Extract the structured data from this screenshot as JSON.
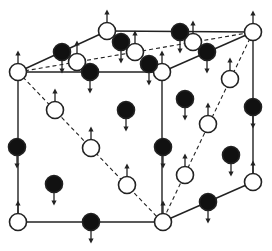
{
  "diagram": {
    "type": "crystal-structure-spin-lattice",
    "colors": {
      "line": "#222222",
      "white_atom": "#ffffff",
      "black_atom": "#111111"
    },
    "solid_lines": [
      [
        18,
        72,
        107,
        31
      ],
      [
        107,
        31,
        253,
        32
      ],
      [
        18,
        72,
        162,
        72
      ],
      [
        162,
        72,
        253,
        32
      ],
      [
        18,
        72,
        18,
        222
      ],
      [
        162,
        72,
        162,
        222
      ],
      [
        253,
        32,
        253,
        182
      ],
      [
        18,
        222,
        162,
        222
      ],
      [
        162,
        222,
        253,
        182
      ]
    ],
    "dashed_lines": [
      [
        18,
        72,
        253,
        32
      ],
      [
        18,
        72,
        162,
        222
      ],
      [
        253,
        32,
        162,
        222
      ]
    ],
    "atoms": [
      {
        "x": 18,
        "y": 72,
        "kind": "white",
        "spin": "up"
      },
      {
        "x": 107,
        "y": 31,
        "kind": "white",
        "spin": "up"
      },
      {
        "x": 77,
        "y": 62,
        "kind": "white",
        "spin": "up"
      },
      {
        "x": 135,
        "y": 52,
        "kind": "white",
        "spin": "up"
      },
      {
        "x": 162,
        "y": 72,
        "kind": "white",
        "spin": "up"
      },
      {
        "x": 193,
        "y": 42,
        "kind": "white",
        "spin": "up"
      },
      {
        "x": 253,
        "y": 32,
        "kind": "white",
        "spin": "up"
      },
      {
        "x": 230,
        "y": 79,
        "kind": "white",
        "spin": "up"
      },
      {
        "x": 55,
        "y": 110,
        "kind": "white",
        "spin": "up"
      },
      {
        "x": 91,
        "y": 148,
        "kind": "white",
        "spin": "up"
      },
      {
        "x": 127,
        "y": 185,
        "kind": "white",
        "spin": "up"
      },
      {
        "x": 208,
        "y": 124,
        "kind": "white",
        "spin": "up"
      },
      {
        "x": 185,
        "y": 175,
        "kind": "white",
        "spin": "up"
      },
      {
        "x": 18,
        "y": 222,
        "kind": "white",
        "spin": "up"
      },
      {
        "x": 163,
        "y": 222,
        "kind": "white",
        "spin": "up"
      },
      {
        "x": 253,
        "y": 182,
        "kind": "white",
        "spin": "up"
      },
      {
        "x": 62,
        "y": 52,
        "kind": "black",
        "spin": "down"
      },
      {
        "x": 90,
        "y": 72,
        "kind": "black",
        "spin": "down"
      },
      {
        "x": 121,
        "y": 42,
        "kind": "black",
        "spin": "down"
      },
      {
        "x": 149,
        "y": 64,
        "kind": "black",
        "spin": "down"
      },
      {
        "x": 180,
        "y": 32,
        "kind": "black",
        "spin": "down"
      },
      {
        "x": 207,
        "y": 52,
        "kind": "black",
        "spin": "down"
      },
      {
        "x": 126,
        "y": 110,
        "kind": "black",
        "spin": "down"
      },
      {
        "x": 185,
        "y": 99,
        "kind": "black",
        "spin": "down"
      },
      {
        "x": 17,
        "y": 147,
        "kind": "black",
        "spin": "down"
      },
      {
        "x": 163,
        "y": 147,
        "kind": "black",
        "spin": "down"
      },
      {
        "x": 253,
        "y": 107,
        "kind": "black",
        "spin": "down"
      },
      {
        "x": 231,
        "y": 155,
        "kind": "black",
        "spin": "down"
      },
      {
        "x": 54,
        "y": 184,
        "kind": "black",
        "spin": "down"
      },
      {
        "x": 91,
        "y": 222,
        "kind": "black",
        "spin": "down"
      },
      {
        "x": 208,
        "y": 202,
        "kind": "black",
        "spin": "down"
      }
    ]
  }
}
